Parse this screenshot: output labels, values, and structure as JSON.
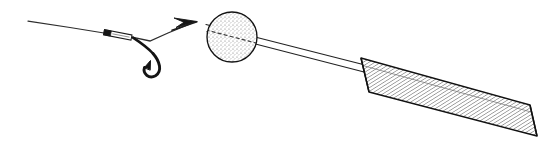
{
  "figure": {
    "title": "Fishing rod line-art illustration",
    "canvas": {
      "width": 550,
      "height": 149,
      "background": "#ffffff"
    },
    "style": {
      "ink_color": "#1a1a1a",
      "line_color": "#2b2b2b",
      "hatch_color": "#3a3a3a",
      "stipple_color": "#4a4a4a",
      "outline_color": "#111111"
    },
    "parts": [
      {
        "name": "fishing-line",
        "label": "Fishing line",
        "path": "M28,21 L106,33 L140,41 L168,31 L186,24",
        "stroke_width": 1.2
      },
      {
        "name": "crimp-sleeve",
        "label": "Crimp sleeve",
        "x": 104,
        "y": 30,
        "length": 28,
        "thickness": 5,
        "angle": 11
      },
      {
        "name": "fish-hook",
        "label": "Fish hook",
        "shank": "M132,37 L152,52",
        "bend": "M152,52 C162,62 164,74 154,76 C145,78 141,70 145,66",
        "barb": "M145,66 L150,62 L149,69 Z",
        "stroke_width": 2.6
      },
      {
        "name": "arrow-head",
        "label": "Arrow head",
        "tip_x": 196,
        "tip_y": 22,
        "angle": -20,
        "length": 22,
        "spread": 9
      },
      {
        "name": "stippled-ball",
        "label": "Stippled ball float",
        "cx": 232,
        "cy": 37,
        "r": 25,
        "fill": "stipple",
        "dash_line": "M209,31 L256,43"
      },
      {
        "name": "rod-shaft",
        "label": "Tapered rod shaft",
        "top_edge": "M206,24 L366,65",
        "bottom_edge": "M207,31 L365,72",
        "stroke_width": 1.1
      },
      {
        "name": "rod-handle",
        "label": "Hatched rod handle grip",
        "corners": "361,58 369,92 537,136 530,105",
        "hatch_angle": 58,
        "hatch_spacing": 3
      }
    ]
  }
}
